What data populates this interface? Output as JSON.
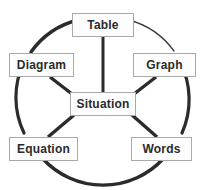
{
  "diagram": {
    "type": "cycle-hub-and-spoke",
    "background_color": "#ffffff",
    "line_color": "#2b2b2b",
    "box_fill_color": "#fdfdfd",
    "box_border_color": "#a9a9a9",
    "text_color": "#2b2b2b",
    "center": {
      "id": "situation",
      "label": "Situation"
    },
    "nodes": [
      {
        "id": "table",
        "label": "Table",
        "position": "top"
      },
      {
        "id": "graph",
        "label": "Graph",
        "position": "right-top"
      },
      {
        "id": "words",
        "label": "Words",
        "position": "right-bottom"
      },
      {
        "id": "equation",
        "label": "Equation",
        "position": "left-bottom"
      },
      {
        "id": "diagram",
        "label": "Diagram",
        "position": "left-top"
      }
    ],
    "spokes": [
      {
        "from": "situation",
        "to": "table"
      },
      {
        "from": "situation",
        "to": "graph"
      },
      {
        "from": "situation",
        "to": "words"
      },
      {
        "from": "situation",
        "to": "equation"
      },
      {
        "from": "situation",
        "to": "diagram"
      }
    ],
    "ring_arcs": [
      {
        "from": "diagram",
        "to": "table",
        "weight": "thick"
      },
      {
        "from": "table",
        "to": "graph",
        "weight": "thin"
      },
      {
        "from": "graph",
        "to": "words",
        "weight": "thick"
      },
      {
        "from": "words",
        "to": "equation",
        "weight": "thick"
      },
      {
        "from": "equation",
        "to": "diagram",
        "weight": "thick"
      }
    ]
  }
}
